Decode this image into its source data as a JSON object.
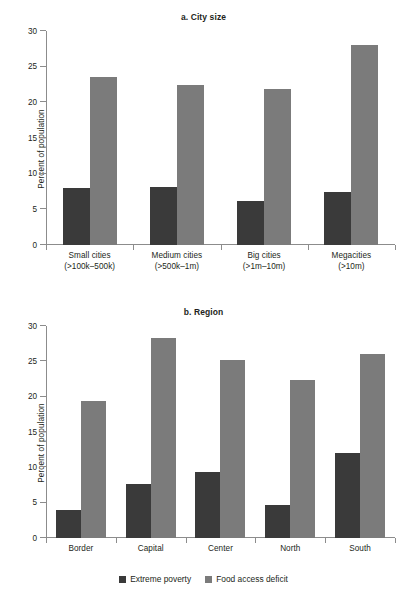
{
  "colors": {
    "series_dark": "#3a3a3a",
    "series_light": "#7b7b7b",
    "axis": "#8c8c8c",
    "text": "#231f20",
    "background": "#ffffff"
  },
  "legend": {
    "items": [
      {
        "label": "Extreme poverty",
        "color": "#3a3a3a"
      },
      {
        "label": "Food access deficit",
        "color": "#7b7b7b"
      }
    ]
  },
  "panel_a": {
    "title": "a. City size",
    "ylabel": "Percent of population",
    "yticks": [
      "30",
      "25",
      "20",
      "15",
      "10",
      "5",
      "0"
    ],
    "categories": [
      {
        "line1": "Small cities",
        "line2": "(>100k–500k)"
      },
      {
        "line1": "Medium cities",
        "line2": "(>500k–1m)"
      },
      {
        "line1": "Big cities",
        "line2": "(>1m–10m)"
      },
      {
        "line1": "Megacities",
        "line2": "(>10m)"
      }
    ]
  },
  "panel_b": {
    "title": "b. Region",
    "ylabel": "Percent of population",
    "yticks": [
      "30",
      "25",
      "20",
      "15",
      "10",
      "5",
      "0"
    ],
    "categories": [
      {
        "line1": "Border",
        "line2": ""
      },
      {
        "line1": "Capital",
        "line2": ""
      },
      {
        "line1": "Center",
        "line2": ""
      },
      {
        "line1": "North",
        "line2": ""
      },
      {
        "line1": "South",
        "line2": ""
      }
    ]
  },
  "chart_data": [
    {
      "type": "bar",
      "title": "a. City size",
      "xlabel": "",
      "ylabel": "Percent of population",
      "ylim": [
        0,
        30
      ],
      "ytick_step": 5,
      "grid": false,
      "legend_position": "bottom-figure",
      "categories": [
        "Small cities (>100k–500k)",
        "Medium cities (>500k–1m)",
        "Big cities (>1m–10m)",
        "Megacities (>10m)"
      ],
      "series": [
        {
          "name": "Extreme poverty",
          "color": "#3a3a3a",
          "values": [
            8.0,
            8.2,
            6.2,
            7.4
          ]
        },
        {
          "name": "Food access deficit",
          "color": "#7b7b7b",
          "values": [
            23.5,
            22.4,
            21.9,
            28.0
          ]
        }
      ]
    },
    {
      "type": "bar",
      "title": "b. Region",
      "xlabel": "",
      "ylabel": "Percent of population",
      "ylim": [
        0,
        30
      ],
      "ytick_step": 5,
      "grid": false,
      "legend_position": "bottom-figure",
      "categories": [
        "Border",
        "Capital",
        "Center",
        "North",
        "South"
      ],
      "series": [
        {
          "name": "Extreme poverty",
          "color": "#3a3a3a",
          "values": [
            3.9,
            7.6,
            9.3,
            4.7,
            12.1
          ]
        },
        {
          "name": "Food access deficit",
          "color": "#7b7b7b",
          "values": [
            19.4,
            28.3,
            25.2,
            22.4,
            26.0
          ]
        }
      ]
    }
  ]
}
